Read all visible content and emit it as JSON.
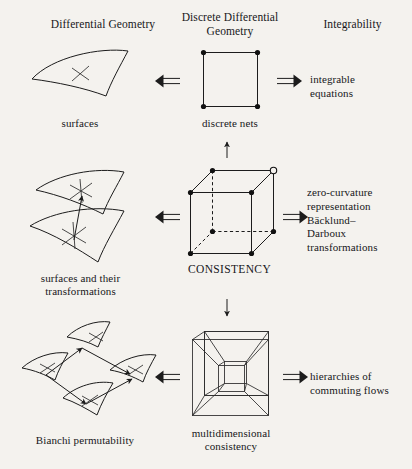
{
  "figure": {
    "background_color": "#f4f2ee",
    "ink_color": "#1a1a1a",
    "columns": [
      {
        "id": "differential-geometry",
        "heading": "Differential Geometry"
      },
      {
        "id": "discrete-differential-geometry",
        "heading": "Discrete Differential\nGeometry"
      },
      {
        "id": "integrability",
        "heading": "Integrability"
      }
    ],
    "rows": [
      {
        "id": "row-surfaces",
        "left_caption": "surfaces",
        "center_caption": "discrete nets",
        "right_text": "integrable\nequations",
        "left_arrow": "double-left-arrow",
        "right_arrow": "double-right-arrow",
        "center_figure": "square-with-four-vertices"
      },
      {
        "id": "row-transformations",
        "left_caption": "surfaces and their\ntransformations",
        "center_caption": "CONSISTENCY",
        "right_text": "zero-curvature\nrepresentation\nBäcklund–\nDarboux\ntransformations",
        "left_arrow": "double-left-arrow",
        "right_arrow": "double-right-arrow",
        "center_figure": "cube-with-eight-vertices"
      },
      {
        "id": "row-multidimensional",
        "left_caption": "Bianchi permutability",
        "center_caption": "multidimensional\nconsistency",
        "right_text": "hierarchies of\ncommuting flows",
        "left_arrow": "double-left-arrow",
        "right_arrow": "double-right-arrow",
        "center_figure": "tesseract-hypercube"
      }
    ],
    "vertical_connectors": [
      {
        "id": "up-arrow-square-to-cube",
        "glyph": "↑"
      },
      {
        "id": "down-arrow-cube-to-tesseract",
        "glyph": "↓"
      }
    ]
  }
}
